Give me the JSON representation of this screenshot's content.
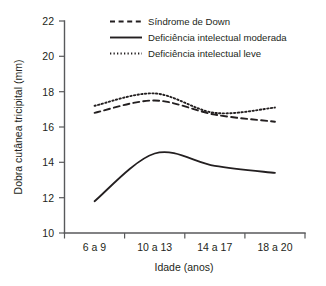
{
  "chart_data": {
    "type": "line",
    "title": "",
    "xlabel": "Idade (anos)",
    "ylabel": "Dobra cutânea tricipital (mm)",
    "categories": [
      "6 a 9",
      "10 a 13",
      "14 a 17",
      "18 a 20"
    ],
    "yticks": [
      "10",
      "12",
      "14",
      "16",
      "18",
      "20",
      "22"
    ],
    "ylim": [
      10,
      22
    ],
    "grid": false,
    "legend_position": "top-center",
    "series": [
      {
        "name": "Síndrome de Down",
        "style": "dashed",
        "values": [
          16.8,
          17.5,
          16.7,
          16.3
        ]
      },
      {
        "name": "Deficiência intelectual moderada",
        "style": "solid",
        "values": [
          11.8,
          14.5,
          13.8,
          13.4
        ]
      },
      {
        "name": "Deficiência intelectual leve",
        "style": "dotted",
        "values": [
          17.2,
          17.9,
          16.8,
          17.1
        ]
      }
    ]
  },
  "axis": {
    "y_tick_0": "10",
    "y_tick_1": "12",
    "y_tick_2": "14",
    "y_tick_3": "16",
    "y_tick_4": "18",
    "y_tick_5": "20",
    "y_tick_6": "22",
    "x_tick_0": "6 a 9",
    "x_tick_1": "10 a 13",
    "x_tick_2": "14 a 17",
    "x_tick_3": "18 a 20",
    "x_title": "Idade (anos)",
    "y_title": "Dobra cutânea tricipital (mm)"
  },
  "legend": {
    "item_0": "Síndrome de Down",
    "item_1": "Deficiência intelectual moderada",
    "item_2": "Deficiência intelectual leve"
  },
  "colors": {
    "ink": "#231f20",
    "axis": "#58595b",
    "background": "#ffffff"
  }
}
